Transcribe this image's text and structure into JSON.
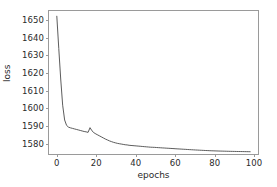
{
  "chart_data": {
    "type": "line",
    "title": "",
    "xlabel": "epochs",
    "ylabel": "loss",
    "xlim": [
      -4,
      103
    ],
    "ylim": [
      1573,
      1655
    ],
    "xticks": [
      0,
      20,
      40,
      60,
      80,
      100
    ],
    "yticks": [
      1580,
      1590,
      1600,
      1610,
      1620,
      1630,
      1640,
      1650
    ],
    "xtick_labels": [
      "0",
      "20",
      "40",
      "60",
      "80",
      "100"
    ],
    "ytick_labels": [
      "1580",
      "1590",
      "1600",
      "1610",
      "1620",
      "1630",
      "1640",
      "1650"
    ],
    "grid": false,
    "legend": null,
    "line_color": "#4a4a4a",
    "line_width": 0.9,
    "axis_color": "#9a9a9a",
    "background": "#ffffff",
    "series": [
      {
        "name": "loss",
        "x": [
          0,
          1,
          2,
          3,
          4,
          5,
          6,
          7,
          8,
          9,
          10,
          11,
          12,
          13,
          14,
          15,
          16,
          17,
          18,
          19,
          20,
          21,
          22,
          23,
          24,
          25,
          26,
          27,
          28,
          29,
          30,
          31,
          32,
          33,
          34,
          35,
          36,
          37,
          38,
          39,
          40,
          41,
          42,
          43,
          44,
          45,
          46,
          47,
          48,
          49,
          50,
          51,
          52,
          53,
          54,
          55,
          56,
          57,
          58,
          59,
          60,
          61,
          62,
          63,
          64,
          65,
          66,
          67,
          68,
          69,
          70,
          71,
          72,
          73,
          74,
          75,
          76,
          77,
          78,
          79,
          80,
          81,
          82,
          83,
          84,
          85,
          86,
          87,
          88,
          89,
          90,
          91,
          92,
          93,
          94,
          95,
          96,
          97,
          98,
          99
        ],
        "y": [
          1652.0,
          1633.5,
          1616.0,
          1601.0,
          1592.5,
          1589.4,
          1588.4,
          1588.0,
          1587.7,
          1587.4,
          1587.1,
          1586.8,
          1586.5,
          1586.2,
          1585.9,
          1585.7,
          1585.4,
          1588.1,
          1586.3,
          1585.2,
          1584.5,
          1583.9,
          1583.3,
          1582.7,
          1582.1,
          1581.5,
          1581.0,
          1580.5,
          1580.1,
          1579.7,
          1579.4,
          1579.1,
          1578.9,
          1578.7,
          1578.5,
          1578.3,
          1578.2,
          1578.0,
          1577.9,
          1577.8,
          1577.7,
          1577.6,
          1577.5,
          1577.4,
          1577.3,
          1577.2,
          1577.1,
          1577.0,
          1576.9,
          1576.85,
          1576.8,
          1576.72,
          1576.65,
          1576.58,
          1576.5,
          1576.43,
          1576.36,
          1576.29,
          1576.22,
          1576.15,
          1576.08,
          1576.0,
          1575.93,
          1575.86,
          1575.79,
          1575.72,
          1575.65,
          1575.58,
          1575.51,
          1575.44,
          1575.38,
          1575.31,
          1575.25,
          1575.19,
          1575.13,
          1575.07,
          1575.01,
          1574.96,
          1574.91,
          1574.86,
          1574.82,
          1574.78,
          1574.74,
          1574.7,
          1574.67,
          1574.64,
          1574.61,
          1574.58,
          1574.55,
          1574.52,
          1574.5,
          1574.47,
          1574.45,
          1574.43,
          1574.41,
          1574.39,
          1574.37,
          1574.35,
          1574.33,
          1574.3
        ]
      }
    ],
    "annotations": [
      {
        "label": "spike",
        "x": 17,
        "y": 1588.1
      }
    ]
  }
}
